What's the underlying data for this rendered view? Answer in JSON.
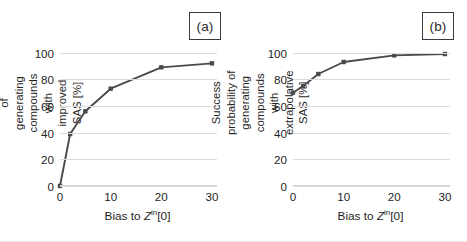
{
  "figure": {
    "background": "#ffffff",
    "series_color": "#4a4a4a",
    "grid_color": "#dcdcdc"
  },
  "panels": [
    {
      "label": "(a)",
      "ylabel": "Success probability of generating compounds with improved SAS [%]",
      "xlabel_prefix": "Bias to ",
      "xlabel_var": "Z",
      "xlabel_sup": "in",
      "xlabel_suffix": "[0]",
      "yticks": [
        "0",
        "20",
        "40",
        "60",
        "80",
        "100"
      ],
      "xticks": [
        "0",
        "10",
        "20",
        "30"
      ]
    },
    {
      "label": "(b)",
      "ylabel": "Success probability of generating compounds with extrapolative SAS [%]",
      "xlabel_prefix": "Bias to ",
      "xlabel_var": "Z",
      "xlabel_sup": "in",
      "xlabel_suffix": "[0]",
      "yticks": [
        "0",
        "20",
        "40",
        "60",
        "80",
        "100"
      ],
      "xticks": [
        "0",
        "10",
        "20",
        "30"
      ]
    }
  ],
  "chart_data": [
    {
      "type": "line",
      "title": "(a)",
      "xlabel": "Bias to Z^in[0]",
      "ylabel": "Success probability of generating compounds with improved SAS [%]",
      "x": [
        0,
        2,
        5,
        10,
        20,
        30
      ],
      "values": [
        0,
        39,
        56,
        73,
        89,
        92
      ],
      "series": [
        {
          "name": "improved SAS",
          "values": [
            0,
            39,
            56,
            73,
            89,
            92
          ]
        }
      ],
      "xlim": [
        0,
        31
      ],
      "ylim": [
        0,
        105
      ],
      "xticks": [
        0,
        10,
        20,
        30
      ],
      "yticks": [
        0,
        20,
        40,
        60,
        80,
        100
      ],
      "grid": "horizontal",
      "legend": "none",
      "marker": "square",
      "color": "#4a4a4a"
    },
    {
      "type": "line",
      "title": "(b)",
      "xlabel": "Bias to Z^in[0]",
      "ylabel": "Success probability of generating compounds with extrapolative SAS [%]",
      "x": [
        0,
        2,
        5,
        10,
        20,
        30
      ],
      "values": [
        70,
        75,
        84,
        93,
        98,
        99
      ],
      "series": [
        {
          "name": "extrapolative SAS",
          "values": [
            70,
            75,
            84,
            93,
            98,
            99
          ]
        }
      ],
      "xlim": [
        0,
        31
      ],
      "ylim": [
        0,
        105
      ],
      "xticks": [
        0,
        10,
        20,
        30
      ],
      "yticks": [
        0,
        20,
        40,
        60,
        80,
        100
      ],
      "grid": "horizontal",
      "legend": "none",
      "marker": "square",
      "color": "#4a4a4a"
    }
  ]
}
